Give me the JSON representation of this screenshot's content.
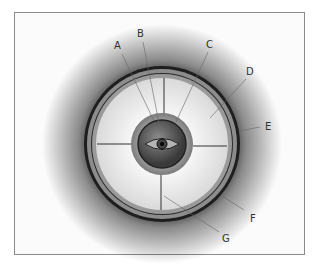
{
  "diagram": {
    "labels": [
      {
        "id": "A",
        "text": "A"
      },
      {
        "id": "B",
        "text": "B"
      },
      {
        "id": "C",
        "text": "C"
      },
      {
        "id": "D",
        "text": "D"
      },
      {
        "id": "E",
        "text": "E"
      },
      {
        "id": "F",
        "text": "F"
      },
      {
        "id": "G",
        "text": "G"
      }
    ],
    "colors": {
      "frame": "#8a8a8a",
      "outer_ring": "#1e1e1e",
      "band": "#8c8c8c",
      "inner_disc": "#eeeeee",
      "core": "#5a5a5a"
    }
  }
}
